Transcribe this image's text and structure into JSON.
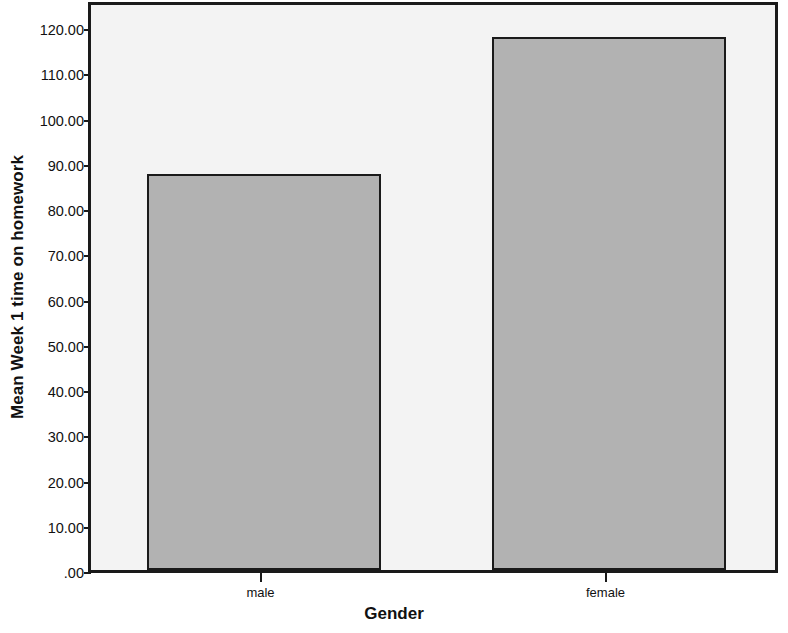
{
  "chart_data": {
    "type": "bar",
    "title": "",
    "categories": [
      "male",
      "female"
    ],
    "values": [
      87.5,
      117.8
    ],
    "xlabel": "Gender",
    "ylabel": "Mean Week 1 time on homework",
    "ylim": [
      0,
      126
    ],
    "yticks": [
      0,
      10,
      20,
      30,
      40,
      50,
      60,
      70,
      80,
      90,
      100,
      110,
      120
    ],
    "ytick_labels": [
      ".00",
      "10.00",
      "20.00",
      "30.00",
      "40.00",
      "50.00",
      "60.00",
      "70.00",
      "80.00",
      "90.00",
      "100.00",
      "110.00",
      "120.00"
    ],
    "grid": false,
    "legend": null,
    "bar_fill_color": "#b2b2b2",
    "bar_edge_color": "#1a1a1a",
    "plot_background_color": "#f3f3f3",
    "figure_background_color": "#ffffff",
    "axis_color": "#1a1a1a"
  }
}
